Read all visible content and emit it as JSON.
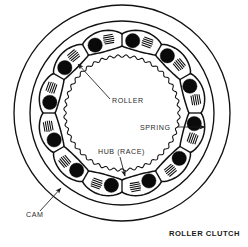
{
  "figure": {
    "title": "ROLLER CLUTCH",
    "background_color": "#ffffff",
    "ink_color": "#111111",
    "roller_fill": "#0a0a0a",
    "labels": {
      "roller": "ROLLER",
      "spring": "SPRING",
      "hub": "HUB (RACE)",
      "cam": "CAM"
    }
  },
  "chart_data": {
    "type": "diagram",
    "title": "ROLLER CLUTCH",
    "view": "axial cross-section, viewed along shaft axis",
    "center": {
      "x": 122,
      "y": 113
    },
    "components": [
      {
        "name": "CAM",
        "label": "CAM",
        "description": "outer cam ring / housing with cam pockets",
        "outer_radius": 108,
        "inner_radius": 92,
        "ring_count": 2,
        "fill": "none",
        "stroke": "#111111"
      },
      {
        "name": "ROLLER",
        "label": "ROLLER",
        "description": "solid black cylindrical rollers seated in cam pockets",
        "count": 12,
        "radius": 7.2,
        "orbit_radius": 73,
        "fill": "#0a0a0a"
      },
      {
        "name": "SPRING",
        "label": "SPRING",
        "description": "leaf/accordion springs drawn as parallel hatch lines, one per pocket, trailing each roller",
        "count": 12,
        "hatch_lines": 5,
        "orbit_radius": 75,
        "stroke": "#0a0a0a"
      },
      {
        "name": "HUB (RACE)",
        "label": "HUB (RACE)",
        "description": "inner hub with finely serrated / scalloped outer race surface",
        "radius": 57,
        "serration_count": 44,
        "serration_depth": 2.6,
        "fill": "#ffffff",
        "stroke": "#111111"
      },
      {
        "name": "POCKET RING",
        "description": "scalloped cam-pocket band between cam inner wall and hub race",
        "outer_radius": 84,
        "inner_radius": 64,
        "pocket_count": 12
      }
    ],
    "callouts": [
      {
        "label": "ROLLER",
        "text_x": 112,
        "text_y": 103,
        "anchor": "start",
        "leader_from": [
          110,
          99
        ],
        "leader_to": [
          78,
          64
        ],
        "arrow_at": "leader_to",
        "points_to": "a black roller at upper-left of ring"
      },
      {
        "label": "SPRING",
        "text_x": 140,
        "text_y": 130,
        "anchor": "start",
        "leader_from": [
          177,
          127
        ],
        "leader_to": [
          205,
          127
        ],
        "arrow_at": "leader_to",
        "points_to": "hatched spring on right side of ring"
      },
      {
        "label": "HUB (RACE)",
        "text_x": 98,
        "text_y": 154,
        "anchor": "start",
        "leader_from": [
          120,
          157
        ],
        "leader_to": [
          125,
          176
        ],
        "arrow_at": "leader_to",
        "points_to": "serrated hub race surface at lower area"
      },
      {
        "label": "CAM",
        "text_x": 26,
        "text_y": 217,
        "anchor": "start",
        "leader_from": [
          40,
          211
        ],
        "leader_to": [
          61,
          188
        ],
        "arrow_at": "leader_to",
        "points_to": "outer cam ring at lower-left"
      }
    ],
    "title_position": {
      "x": 240,
      "y": 236,
      "anchor": "end"
    },
    "grid": false,
    "legend": false,
    "axis": false
  }
}
